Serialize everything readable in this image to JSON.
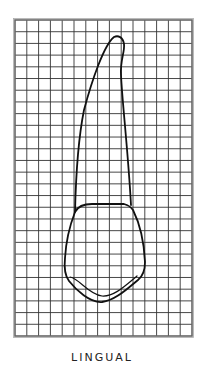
{
  "diagram": {
    "caption": "LINGUAL",
    "grid": {
      "left": 15,
      "top": 20,
      "right": 192,
      "bottom": 336,
      "cols": 15,
      "rows": 27,
      "line_color": "#333333",
      "border_color": "#555555"
    },
    "outline_color": "#111111"
  }
}
